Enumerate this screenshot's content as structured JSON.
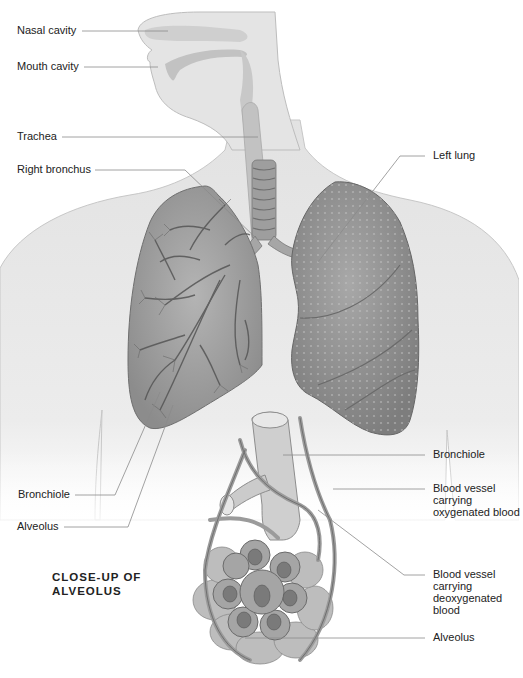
{
  "diagram": {
    "type": "anatomical illustration",
    "style": "grayscale pencil rendering",
    "colors": {
      "background": "#ffffff",
      "skin": "#e6e6e6",
      "skin_outline": "#bdbdbd",
      "lung_fill": "#9a9a9a",
      "lung_dark": "#7f7f7f",
      "airway": "#b5b5b5",
      "leader_line": "#888888",
      "text": "#222222"
    }
  },
  "labels": {
    "nasal_cavity": "Nasal cavity",
    "mouth_cavity": "Mouth cavity",
    "trachea": "Trachea",
    "right_bronchus": "Right bronchus",
    "left_lung": "Left lung",
    "bronchiole_left": "Bronchiole",
    "alveolus_left": "Alveolus",
    "bronchiole_right": "Bronchiole",
    "vessel_oxygenated": "Blood vessel carrying oxygenated blood",
    "vessel_deoxygenated": "Blood vessel carrying deoxygenated blood",
    "alveolus_right": "Alveolus"
  },
  "inset": {
    "title": "CLOSE-UP OF ALVEOLUS"
  }
}
